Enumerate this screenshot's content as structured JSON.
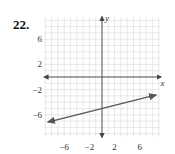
{
  "problem": {
    "number": "22."
  },
  "chart_data": {
    "type": "line",
    "title": "",
    "xlabel": "x",
    "ylabel": "y",
    "xlim": [
      -9,
      9
    ],
    "ylim": [
      -9,
      10
    ],
    "grid": true,
    "grid_step": 1,
    "x_ticks": [
      -6,
      -2,
      2,
      6
    ],
    "y_ticks": [
      6,
      2,
      -2,
      -6
    ],
    "x_tick_labels": [
      "−6",
      "−2",
      "2",
      "6"
    ],
    "y_tick_labels": [
      "6",
      "2",
      "−2",
      "−6"
    ],
    "series": [
      {
        "name": "line",
        "equation": "y = (1/4)x − 5",
        "slope": 0.25,
        "intercept": -5,
        "x": [
          -8.6,
          8.6
        ],
        "y": [
          -7.15,
          -2.85
        ],
        "arrows": "both"
      }
    ],
    "colors": {
      "grid": "#d9d9d9",
      "axis": "#444444",
      "line": "#555555"
    }
  }
}
